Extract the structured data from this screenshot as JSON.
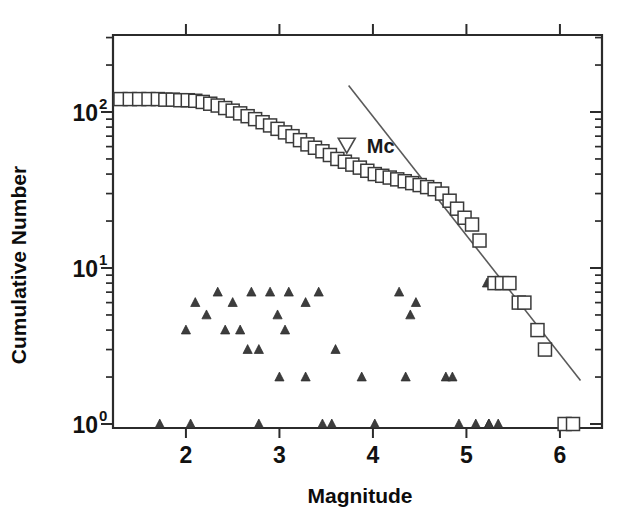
{
  "chart_data": {
    "type": "scatter",
    "title": "",
    "xlabel": "Magnitude",
    "ylabel": "Cumulative Number",
    "xlim": [
      1.22,
      6.45
    ],
    "ylim": [
      1,
      180
    ],
    "yscale": "log",
    "xticks": [
      2,
      3,
      4,
      5,
      6
    ],
    "xticklabels": [
      "2",
      "3",
      "4",
      "5",
      "6"
    ],
    "yticks": [
      1,
      10,
      100
    ],
    "yticklabels": [
      "10",
      "10",
      "10"
    ],
    "ytick_exponents": [
      "0",
      "1",
      "2"
    ],
    "grid": false,
    "legend": false,
    "series": [
      {
        "name": "cumulative-number-squares",
        "marker": "open-square",
        "points": [
          [
            1.3,
            121
          ],
          [
            1.4,
            121
          ],
          [
            1.5,
            121
          ],
          [
            1.6,
            121
          ],
          [
            1.7,
            121
          ],
          [
            1.78,
            120
          ],
          [
            1.86,
            120
          ],
          [
            1.94,
            119
          ],
          [
            2.02,
            119
          ],
          [
            2.1,
            118
          ],
          [
            2.18,
            116
          ],
          [
            2.26,
            113
          ],
          [
            2.34,
            110
          ],
          [
            2.42,
            106
          ],
          [
            2.5,
            102
          ],
          [
            2.58,
            98
          ],
          [
            2.66,
            94
          ],
          [
            2.74,
            90
          ],
          [
            2.82,
            86
          ],
          [
            2.9,
            82
          ],
          [
            2.98,
            78
          ],
          [
            3.06,
            74
          ],
          [
            3.14,
            70
          ],
          [
            3.22,
            66
          ],
          [
            3.3,
            62
          ],
          [
            3.38,
            59
          ],
          [
            3.46,
            56
          ],
          [
            3.54,
            53
          ],
          [
            3.62,
            50
          ],
          [
            3.7,
            48
          ],
          [
            3.78,
            46
          ],
          [
            3.86,
            44
          ],
          [
            3.94,
            42
          ],
          [
            4.02,
            40
          ],
          [
            4.1,
            39
          ],
          [
            4.18,
            38
          ],
          [
            4.26,
            37
          ],
          [
            4.34,
            36
          ],
          [
            4.42,
            35
          ],
          [
            4.5,
            34
          ],
          [
            4.58,
            33
          ],
          [
            4.66,
            32
          ],
          [
            4.74,
            30
          ],
          [
            4.82,
            27
          ],
          [
            4.9,
            24
          ],
          [
            4.98,
            21
          ],
          [
            5.06,
            19
          ],
          [
            5.14,
            15
          ],
          [
            5.3,
            8
          ],
          [
            5.38,
            8
          ],
          [
            5.46,
            8
          ],
          [
            5.56,
            6
          ],
          [
            5.62,
            6
          ],
          [
            5.76,
            4
          ],
          [
            5.84,
            3
          ],
          [
            6.05,
            1
          ],
          [
            6.14,
            1
          ]
        ]
      },
      {
        "name": "incremental-number-triangles",
        "marker": "filled-triangle",
        "points": [
          [
            1.72,
            1
          ],
          [
            2.05,
            1
          ],
          [
            2.78,
            1
          ],
          [
            3.46,
            1
          ],
          [
            3.56,
            1
          ],
          [
            4.02,
            1
          ],
          [
            4.92,
            1
          ],
          [
            5.1,
            1
          ],
          [
            5.24,
            1
          ],
          [
            5.34,
            1
          ],
          [
            6.14,
            1
          ],
          [
            3.0,
            2
          ],
          [
            3.28,
            2
          ],
          [
            3.88,
            2
          ],
          [
            4.35,
            2
          ],
          [
            4.78,
            2
          ],
          [
            4.85,
            2
          ],
          [
            2.66,
            3
          ],
          [
            2.78,
            3
          ],
          [
            3.6,
            3
          ],
          [
            2.0,
            4
          ],
          [
            2.42,
            4
          ],
          [
            2.58,
            4
          ],
          [
            3.06,
            4
          ],
          [
            2.22,
            5
          ],
          [
            2.98,
            5
          ],
          [
            4.4,
            5
          ],
          [
            2.1,
            6
          ],
          [
            2.5,
            6
          ],
          [
            3.28,
            6
          ],
          [
            4.46,
            6
          ],
          [
            2.34,
            7
          ],
          [
            2.7,
            7
          ],
          [
            2.9,
            7
          ],
          [
            3.1,
            7
          ],
          [
            3.42,
            7
          ],
          [
            4.28,
            7
          ],
          [
            5.22,
            8
          ],
          [
            5.24,
            1
          ]
        ]
      }
    ],
    "fit_line": {
      "name": "gutenberg-richter-fit",
      "x1": 3.74,
      "y1": 148,
      "x2": 6.22,
      "y2": 1.9
    },
    "annotations": [
      {
        "name": "mc-marker",
        "label": "Mc",
        "marker": "open-triangle-down",
        "x": 3.72,
        "y": 61
      }
    ]
  }
}
